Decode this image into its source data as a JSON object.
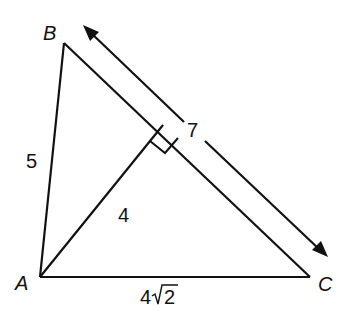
{
  "diagram": {
    "type": "geometry-triangle",
    "stroke_color": "#111111",
    "background": "#ffffff",
    "vertices": {
      "A": {
        "label": "A",
        "x": 40,
        "y": 277
      },
      "B": {
        "label": "B",
        "x": 64,
        "y": 43
      },
      "C": {
        "label": "C",
        "x": 310,
        "y": 277
      }
    },
    "altitude_foot": {
      "x": 163,
      "y": 125
    },
    "labels": {
      "vertex_a": "A",
      "vertex_b": "B",
      "vertex_c": "C",
      "side_ab": "5",
      "side_bc": "7",
      "altitude": "4",
      "side_ac_coeff": "4",
      "side_ac_radicand": "2"
    },
    "measurements": {
      "AB": "5",
      "BC": "7",
      "altitude_from_A": "4",
      "AC": "4√2"
    },
    "annotations": {
      "right_angle_marker": true,
      "double_arrow_along_bc": true
    }
  }
}
